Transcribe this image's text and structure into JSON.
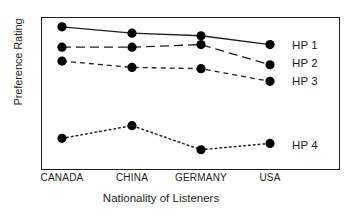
{
  "chart_data": {
    "type": "line",
    "title": "",
    "xlabel": "Nationality of Listeners",
    "ylabel": "Preference Rating",
    "categories": [
      "CANADA",
      "CHINA",
      "GERMANY",
      "USA"
    ],
    "ylim": [
      1,
      7
    ],
    "yticks": [
      1,
      2,
      3,
      4,
      5,
      6,
      7
    ],
    "ytick_labels": [
      "1",
      "2",
      "3",
      "4",
      "5",
      "6",
      "7"
    ],
    "grid": false,
    "legend_position": "right-inside",
    "marker": "filled-circle",
    "marker_color": "#000000",
    "line_color": "#231f20",
    "series": [
      {
        "name": "HP 1",
        "linestyle": "solid",
        "values": [
          6.65,
          6.4,
          6.3,
          5.95
        ]
      },
      {
        "name": "HP 2",
        "linestyle": "long-dashed",
        "values": [
          5.85,
          5.85,
          5.95,
          5.15
        ]
      },
      {
        "name": "HP 3",
        "linestyle": "dashed",
        "values": [
          5.3,
          5.05,
          5.0,
          4.5
        ]
      },
      {
        "name": "HP 4",
        "linestyle": "dotted",
        "values": [
          2.25,
          2.75,
          1.8,
          2.05
        ]
      }
    ]
  },
  "axis": {
    "y_title": "Preference Rating",
    "x_title": "Nationality of Listeners",
    "y_tick_1": "1",
    "y_tick_2": "2",
    "y_tick_3": "3",
    "y_tick_4": "4",
    "y_tick_5": "5",
    "y_tick_6": "6",
    "y_tick_7": "7",
    "x_tick_1": "CANADA",
    "x_tick_2": "CHINA",
    "x_tick_3": "GERMANY",
    "x_tick_4": "USA"
  },
  "legend": {
    "item_1": "HP 1",
    "item_2": "HP 2",
    "item_3": "HP 3",
    "item_4": "HP 4"
  }
}
